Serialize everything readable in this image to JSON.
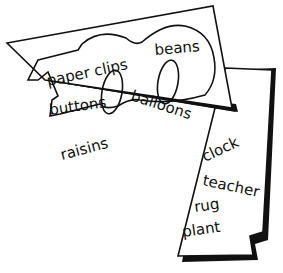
{
  "illustration": {
    "card_one": {
      "numeral": "100",
      "words": [
        "paper clips",
        "beans",
        "buttons",
        "balloons",
        "raisins"
      ]
    },
    "card_two": {
      "words": [
        "clock",
        "teacher",
        "rug",
        "plant"
      ]
    }
  },
  "colors": {
    "ink": "#111111",
    "paper": "#ffffff"
  }
}
